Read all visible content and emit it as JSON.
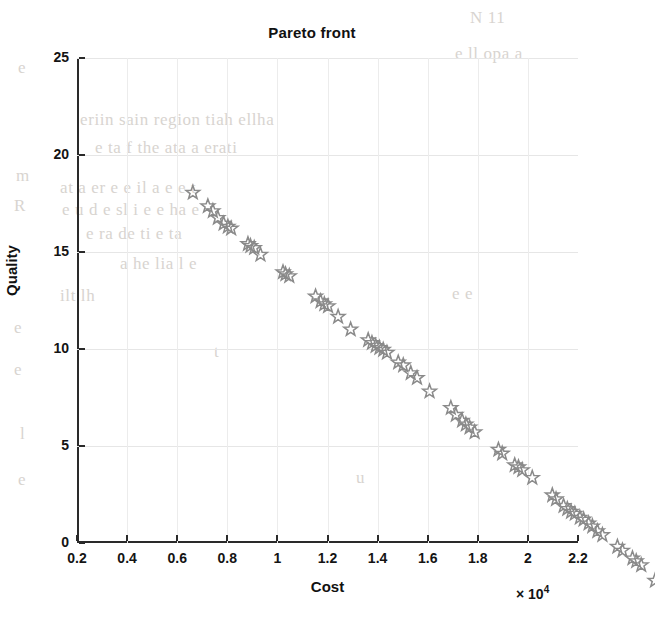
{
  "figure": {
    "title": "Pareto front",
    "marker_color": "#8a8a8a",
    "axis_color": "#2a2a2a",
    "grid_color": "#e6e6e6"
  },
  "axes": {
    "x": {
      "label": "Cost",
      "exponent_prefix": "× 10",
      "exponent_power": "4",
      "exponent_text": "× 10⁴",
      "min": 0.2,
      "max": 2.2,
      "ticks": [
        "0.2",
        "0.4",
        "0.6",
        "0.8",
        "1",
        "1.2",
        "1.4",
        "1.6",
        "1.8",
        "2",
        "2.2"
      ],
      "tick_values": [
        0.2,
        0.4,
        0.6,
        0.8,
        1.0,
        1.2,
        1.4,
        1.6,
        1.8,
        2.0,
        2.2
      ]
    },
    "y": {
      "label": "Quality",
      "min": 0,
      "max": 25,
      "ticks": [
        "0",
        "5",
        "10",
        "15",
        "20",
        "25"
      ],
      "tick_values": [
        0,
        5,
        10,
        15,
        20,
        25
      ]
    }
  },
  "chart_data": {
    "type": "scatter",
    "title": "Pareto front",
    "xlabel": "Cost",
    "ylabel": "Quality",
    "xlim": [
      0.2,
      2.2
    ],
    "ylim": [
      0,
      25
    ],
    "x_scale_note": "x values are in units of 1e4 (axis exponent × 10⁴)",
    "grid": true,
    "legend": null,
    "marker": "pentagram-star-open",
    "series": [
      {
        "name": "Pareto front",
        "x": [
          0.355,
          0.415,
          0.435,
          0.455,
          0.478,
          0.495,
          0.508,
          0.575,
          0.585,
          0.6,
          0.625,
          0.715,
          0.725,
          0.74,
          0.845,
          0.865,
          0.88,
          0.895,
          0.935,
          0.985,
          1.055,
          1.07,
          1.085,
          1.1,
          1.115,
          1.13,
          1.175,
          1.195,
          1.225,
          1.25,
          1.3,
          1.385,
          1.405,
          1.43,
          1.445,
          1.46,
          1.48,
          1.575,
          1.59,
          1.64,
          1.655,
          1.67,
          1.71,
          1.79,
          1.805,
          1.835,
          1.85,
          1.865,
          1.88,
          1.9,
          1.915,
          1.935,
          1.95,
          1.97,
          1.99,
          2.05,
          2.07,
          2.11,
          2.125,
          2.145,
          2.2
        ],
        "y": [
          21.05,
          20.35,
          20.1,
          19.75,
          19.45,
          19.3,
          19.2,
          18.4,
          18.3,
          18.2,
          17.85,
          16.95,
          16.85,
          16.75,
          15.7,
          15.45,
          15.3,
          15.2,
          14.65,
          14.0,
          13.45,
          13.3,
          13.15,
          13.05,
          12.95,
          12.8,
          12.3,
          12.15,
          11.75,
          11.5,
          10.8,
          9.95,
          9.6,
          9.3,
          9.1,
          8.95,
          8.7,
          7.8,
          7.6,
          7.0,
          6.9,
          6.75,
          6.35,
          5.45,
          5.25,
          4.9,
          4.75,
          4.6,
          4.5,
          4.3,
          4.2,
          4.0,
          3.85,
          3.6,
          3.4,
          2.8,
          2.6,
          2.2,
          2.05,
          1.85,
          1.05
        ]
      }
    ]
  },
  "background_bleed": [
    {
      "text": "N 11",
      "x": 470,
      "y": 8
    },
    {
      "text": "e",
      "x": 18,
      "y": 58
    },
    {
      "text": "e ll opa a",
      "x": 455,
      "y": 44
    },
    {
      "text": "eriin sain region tiah ellha",
      "x": 80,
      "y": 110
    },
    {
      "text": "e ta f the ata a erati",
      "x": 95,
      "y": 138
    },
    {
      "text": "m",
      "x": 16,
      "y": 166
    },
    {
      "text": "at a er e e il a e e t",
      "x": 60,
      "y": 178
    },
    {
      "text": "R",
      "x": 14,
      "y": 196
    },
    {
      "text": "e u d e sl i e e ha e",
      "x": 62,
      "y": 200
    },
    {
      "text": "e ra de ti e ta",
      "x": 86,
      "y": 224
    },
    {
      "text": "a he lia l e",
      "x": 120,
      "y": 254
    },
    {
      "text": "ilt lh",
      "x": 60,
      "y": 286
    },
    {
      "text": "e",
      "x": 14,
      "y": 318
    },
    {
      "text": "e",
      "x": 14,
      "y": 360
    },
    {
      "text": "t",
      "x": 214,
      "y": 342
    },
    {
      "text": "e e",
      "x": 452,
      "y": 284
    },
    {
      "text": "l",
      "x": 20,
      "y": 424
    },
    {
      "text": "e",
      "x": 18,
      "y": 470
    },
    {
      "text": "u",
      "x": 356,
      "y": 468
    }
  ]
}
